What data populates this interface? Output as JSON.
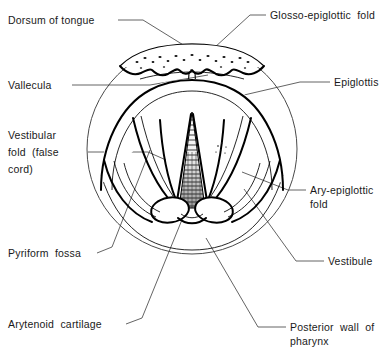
{
  "figure": {
    "background_color": "#ffffff",
    "line_color": "#000000",
    "leader_color": "#3c3c3c",
    "width": 390,
    "height": 356
  },
  "labels": {
    "dorsum_of_tongue": "Dorsum of tongue",
    "vallecula": "Vallecula",
    "vestibular_fold_line1": "Vestibular",
    "vestibular_fold_line2": "fold  (false",
    "vestibular_fold_line3": "cord)",
    "pyriform_fossa": "Pyriform  fossa",
    "arytenoid_cartilage": "Arytenoid  cartilage",
    "glosso_epiglottic_fold": "Glosso-epiglottic  fold",
    "epiglottis": "Epiglottis",
    "ary_epiglottic_fold_line1": "Ary-epiglottic",
    "ary_epiglottic_fold_line2": "fold",
    "vestibule": "Vestibule",
    "posterior_wall_line1": "Posterior  wall  of",
    "posterior_wall_line2": "pharynx"
  },
  "structures": [
    "dorsum-of-tongue",
    "vallecula",
    "glosso-epiglottic-fold",
    "epiglottis",
    "vestibular-fold",
    "vocal-cord",
    "glottis",
    "ary-epiglottic-fold",
    "pyriform-fossa",
    "arytenoid-cartilage",
    "vestibule",
    "posterior-wall-of-pharynx"
  ]
}
